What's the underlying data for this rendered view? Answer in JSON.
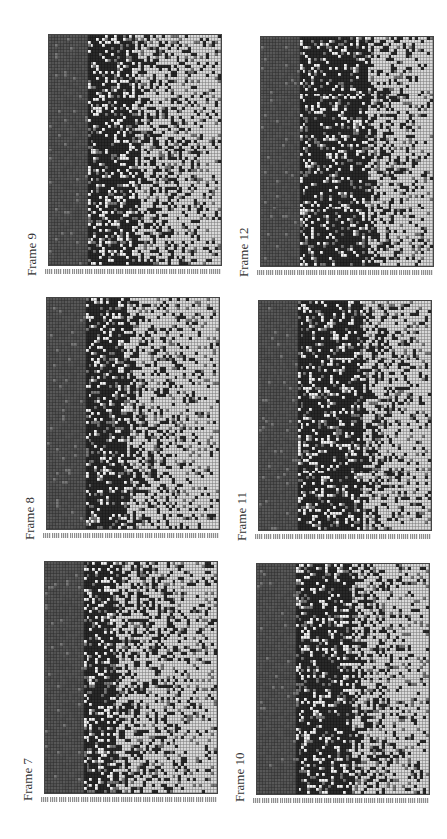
{
  "figure": {
    "orientation": "rotated -90deg (landscape page shown in portrait)",
    "layout": {
      "rows": 3,
      "cols": 2
    }
  },
  "colors": {
    "background": "#ffffff",
    "dark_band": "#555555",
    "very_dark": "#2a2a2a",
    "mid": "#7a7a7a",
    "light": "#d9d9d9",
    "white_speck": "#f2f2f2",
    "gridline": "#444444",
    "label": "#333333"
  },
  "panels": [
    {
      "id": "frame-9",
      "label": "Frame 9",
      "x": 48,
      "y": 34,
      "w": 174,
      "h": 232,
      "label_x": 24,
      "label_y": 276,
      "seed": 9,
      "band_split": 0.22,
      "dark_zone": [
        0.22,
        0.5
      ]
    },
    {
      "id": "frame-12",
      "label": "Frame 12",
      "x": 260,
      "y": 36,
      "w": 174,
      "h": 231,
      "label_x": 236,
      "label_y": 277,
      "seed": 12,
      "band_split": 0.22,
      "dark_zone": [
        0.22,
        0.62
      ]
    },
    {
      "id": "frame-8",
      "label": "Frame 8",
      "x": 46,
      "y": 297,
      "w": 174,
      "h": 233,
      "label_x": 22,
      "label_y": 540,
      "seed": 8,
      "band_split": 0.21,
      "dark_zone": [
        0.21,
        0.45
      ]
    },
    {
      "id": "frame-11",
      "label": "Frame 11",
      "x": 258,
      "y": 300,
      "w": 174,
      "h": 231,
      "label_x": 234,
      "label_y": 541,
      "seed": 11,
      "band_split": 0.22,
      "dark_zone": [
        0.22,
        0.6
      ]
    },
    {
      "id": "frame-7",
      "label": "Frame 7",
      "x": 44,
      "y": 561,
      "w": 174,
      "h": 233,
      "label_x": 20,
      "label_y": 801,
      "seed": 7,
      "band_split": 0.21,
      "dark_zone": [
        0.21,
        0.4
      ]
    },
    {
      "id": "frame-10",
      "label": "Frame 10",
      "x": 256,
      "y": 563,
      "w": 174,
      "h": 232,
      "label_x": 232,
      "label_y": 802,
      "seed": 10,
      "band_split": 0.22,
      "dark_zone": [
        0.22,
        0.55
      ]
    }
  ],
  "chart_data": [
    {
      "type": "heatmap",
      "title": "Frame 7",
      "grid_cols": 58,
      "grid_rows": 77,
      "xlabel": "",
      "ylabel": "",
      "tick_labels": "illegible (rotated row indices along bottom edge)",
      "description": "Left ~21% columns uniform mid-dark gray; dark speckled zone to ~40%; lighter cells with scattered dark pixels toward right edge"
    },
    {
      "type": "heatmap",
      "title": "Frame 8",
      "grid_cols": 58,
      "grid_rows": 77,
      "xlabel": "",
      "ylabel": "",
      "tick_labels": "illegible",
      "description": "Uniform mid-dark band on left; dark zone to ~45%; increasingly light toward right"
    },
    {
      "type": "heatmap",
      "title": "Frame 9",
      "grid_cols": 58,
      "grid_rows": 77,
      "xlabel": "",
      "ylabel": "",
      "tick_labels": "illegible",
      "description": "Uniform mid-dark band on left; dark speckled zone to ~50%; light with dark specks on right"
    },
    {
      "type": "heatmap",
      "title": "Frame 10",
      "grid_cols": 58,
      "grid_rows": 77,
      "xlabel": "",
      "ylabel": "",
      "tick_labels": "illegible",
      "description": "Uniform left band; dark zone widening to ~55%; light region at right"
    },
    {
      "type": "heatmap",
      "title": "Frame 11",
      "grid_cols": 58,
      "grid_rows": 77,
      "xlabel": "",
      "ylabel": "",
      "tick_labels": "illegible",
      "description": "Uniform left band; dark zone to ~60%; light region at right"
    },
    {
      "type": "heatmap",
      "title": "Frame 12",
      "grid_cols": 58,
      "grid_rows": 77,
      "xlabel": "",
      "ylabel": "",
      "tick_labels": "illegible",
      "description": "Uniform left band; dark zone extends to ~62%; scattered dark cells across light right side"
    }
  ]
}
